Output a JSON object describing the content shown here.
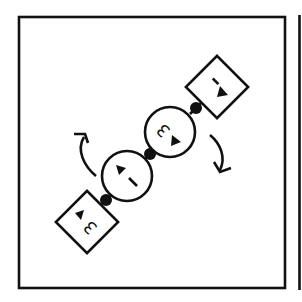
{
  "diagram": {
    "type": "rotation-puzzle-panel",
    "colors": {
      "ink": "#111111",
      "background": "#ffffff"
    },
    "frame": {
      "x": 19,
      "y": 17,
      "width": 266,
      "height": 271
    },
    "neighbor_frame_edge_x": 299,
    "chain_angle_deg": -45,
    "nodes": [
      {
        "id": "square-top",
        "shape": "square",
        "label": "1",
        "arrow": "down-right",
        "cx": 217,
        "cy": 87
      },
      {
        "id": "circle-upper",
        "shape": "circle",
        "label": "3",
        "arrow": "down-right",
        "cx": 170,
        "cy": 132
      },
      {
        "id": "circle-lower",
        "shape": "circle",
        "label": "1",
        "arrow": "up-left",
        "cx": 127,
        "cy": 176
      },
      {
        "id": "square-bottom",
        "shape": "square",
        "label": "3",
        "arrow": "up-left",
        "cx": 87,
        "cy": 222
      }
    ],
    "connectors": [
      {
        "cx": 196,
        "cy": 108
      },
      {
        "cx": 150,
        "cy": 154
      },
      {
        "cx": 106,
        "cy": 200
      }
    ],
    "rotation_arrows": [
      {
        "id": "arrow-left",
        "direction": "clockwise-up",
        "position": "upper-left of chain"
      },
      {
        "id": "arrow-right",
        "direction": "clockwise-down",
        "position": "lower-right of chain"
      }
    ]
  }
}
